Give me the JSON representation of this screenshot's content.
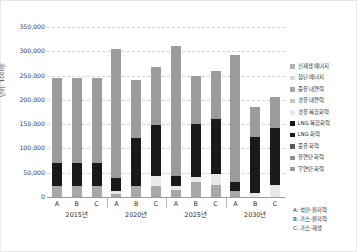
{
  "chart_data": {
    "type": "bar",
    "title": "",
    "xlabel": "",
    "ylabel": "단위: 1000톤",
    "ylim": [
      0,
      350000
    ],
    "ytick_values": [
      0,
      50000,
      100000,
      150000,
      200000,
      250000,
      300000,
      350000
    ],
    "ytick_labels": [
      "0",
      "50,000",
      "100,000",
      "150,000",
      "200,000",
      "250,000",
      "300,000",
      "350,000"
    ],
    "grid": true,
    "stacked": true,
    "legend_position": "right",
    "categories": [
      "A",
      "B",
      "C",
      "A",
      "B",
      "C",
      "A",
      "B",
      "C",
      "A",
      "B",
      "C"
    ],
    "groups": [
      {
        "label": "2015년",
        "members": [
          "A",
          "B",
          "C"
        ]
      },
      {
        "label": "2020년",
        "members": [
          "A",
          "B",
          "C"
        ]
      },
      {
        "label": "2025년",
        "members": [
          "A",
          "B",
          "C"
        ]
      },
      {
        "label": "2030년",
        "members": [
          "A",
          "B",
          "C"
        ]
      }
    ],
    "series": [
      {
        "name": "무연탄 화력",
        "color": "#9b9b9b",
        "values": [
          175000,
          175000,
          175000,
          265000,
          118000,
          118000,
          268000,
          100000,
          100000,
          262000,
          62000,
          62000
        ]
      },
      {
        "name": "유연탄 화력",
        "color": "#8f8f8f",
        "values": [
          0,
          0,
          0,
          0,
          0,
          0,
          0,
          0,
          0,
          0,
          0,
          0
        ]
      },
      {
        "name": "중유 화력",
        "color": "#5a5a5a",
        "values": [
          0,
          0,
          0,
          0,
          0,
          0,
          0,
          0,
          0,
          0,
          0,
          0
        ]
      },
      {
        "name": "LNG 화력",
        "color": "#1a1a1a",
        "values": [
          48000,
          48000,
          48000,
          27000,
          100000,
          105000,
          22000,
          108000,
          112000,
          18000,
          115000,
          118000
        ]
      },
      {
        "name": "LNG 복합화력",
        "color": "#141414",
        "values": [
          0,
          0,
          0,
          0,
          0,
          0,
          0,
          0,
          0,
          0,
          0,
          0
        ]
      },
      {
        "name": "경유 복합화력",
        "color": "#e8e8e8",
        "values": [
          0,
          0,
          0,
          6000,
          0,
          22000,
          8000,
          12000,
          24000,
          0,
          8000,
          25000
        ]
      },
      {
        "name": "경유 내연력",
        "color": "#c4c4c4",
        "values": [
          0,
          0,
          0,
          0,
          0,
          0,
          0,
          0,
          0,
          0,
          0,
          0
        ]
      },
      {
        "name": "중유 내연력",
        "color": "#a8a8a8",
        "values": [
          22000,
          22000,
          22000,
          7000,
          22000,
          22000,
          14000,
          30000,
          24000,
          12000,
          0,
          0
        ]
      },
      {
        "name": "첨단 에너지",
        "color": "#d8d8d8",
        "values": [
          0,
          0,
          0,
          0,
          0,
          0,
          0,
          0,
          0,
          0,
          0,
          0
        ]
      },
      {
        "name": "신재생 에너지",
        "color": "#b0b0b0",
        "values": [
          0,
          0,
          0,
          0,
          0,
          0,
          0,
          0,
          0,
          0,
          0,
          0
        ]
      }
    ],
    "totals": [
      245000,
      245000,
      245000,
      305000,
      240000,
      267000,
      312000,
      250000,
      260000,
      292000,
      185000,
      205000
    ]
  },
  "legend": {
    "items": [
      {
        "label": "신재생 에너지",
        "color": "#b0b0b0"
      },
      {
        "label": "첨단 에너지",
        "color": "#d8d8d8"
      },
      {
        "label": "중유 내연력",
        "color": "#a8a8a8"
      },
      {
        "label": "경유 내연력",
        "color": "#c4c4c4"
      },
      {
        "label": "경유 복합화력",
        "color": "#e8e8e8"
      },
      {
        "label": "LNG 복합화력",
        "color": "#141414"
      },
      {
        "label": "LNG 화력",
        "color": "#1a1a1a"
      },
      {
        "label": "중유 화력",
        "color": "#5a5a5a"
      },
      {
        "label": "유연탄 화력",
        "color": "#8f8f8f"
      },
      {
        "label": "무연탄 화력",
        "color": "#9b9b9b"
      }
    ]
  },
  "notes": {
    "items": [
      "A: 석탄-원자력",
      "B: 가스-원자력",
      "C: 가스-재생"
    ]
  }
}
